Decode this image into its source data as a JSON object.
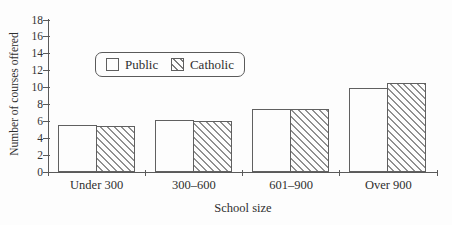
{
  "chart_data": {
    "type": "bar",
    "title": "",
    "categories": [
      "Under 300",
      "300–600",
      "601–900",
      "Over 900"
    ],
    "series": [
      {
        "name": "Public",
        "pattern": "solid-white",
        "values": [
          5.6,
          6.2,
          7.5,
          10.0
        ]
      },
      {
        "name": "Catholic",
        "pattern": "diagonal-hatch",
        "values": [
          5.4,
          6.0,
          7.5,
          10.5
        ]
      }
    ],
    "xlabel": "School size",
    "ylabel": "Number of courses offered",
    "ylim": [
      0,
      18
    ],
    "ytick_step": 2,
    "grid": false,
    "legend_position": "inside-top-left"
  },
  "colors": {
    "background": "#fdfdfd",
    "axis": "#5a5a5a",
    "text": "#2f2f2f",
    "hatch": "#8f8f8f",
    "bar_fill": "#fdfdfd"
  }
}
